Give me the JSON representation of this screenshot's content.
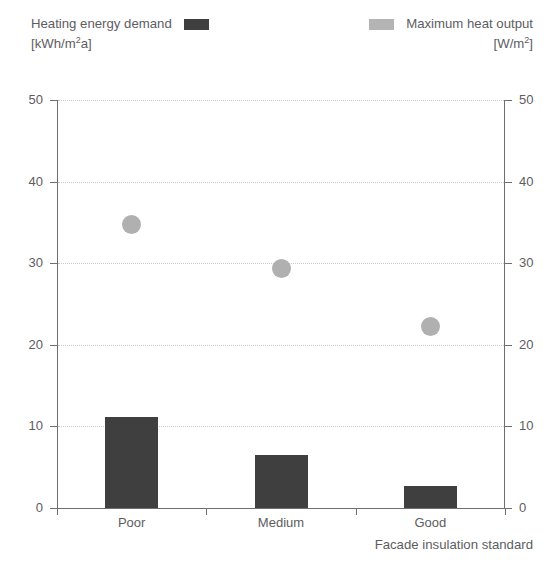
{
  "legend": {
    "left": {
      "label": "Heating energy demand",
      "units": "[kWh/m²a]",
      "units_base": "[kWh/m",
      "units_sup": "2",
      "units_tail": "a]",
      "swatch": "bar-swatch",
      "color": "#3f3f3f"
    },
    "right": {
      "label": "Maximum heat output",
      "units": "[W/m²]",
      "units_base": "[W/m",
      "units_sup": "2",
      "units_tail": "]",
      "swatch": "dot-swatch",
      "color": "#b0b0b0"
    }
  },
  "axes": {
    "x_title": "Facade insulation standard",
    "y_left_ticks": [
      "50",
      "40",
      "30",
      "20",
      "10",
      "0"
    ],
    "y_right_ticks": [
      "50",
      "40",
      "30",
      "20",
      "10",
      "0"
    ]
  },
  "chart_data": {
    "type": "bar",
    "title": "",
    "subtitle": "",
    "categories": [
      "Poor",
      "Medium",
      "Good"
    ],
    "xlabel": "Facade insulation standard",
    "ylabel": "",
    "ylim": [
      0,
      50
    ],
    "y2lim": [
      0,
      50
    ],
    "ytick_values": [
      0,
      10,
      20,
      30,
      40,
      50
    ],
    "y2tick_values": [
      0,
      10,
      20,
      30,
      40,
      50
    ],
    "grid": true,
    "grid_style": "dotted-horizontal",
    "legend_position": "top",
    "series": [
      {
        "name": "Heating energy demand",
        "units": "kWh/m²a",
        "type": "bar",
        "axis": "left",
        "color": "#3f3f3f",
        "values": [
          11.2,
          6.5,
          2.7
        ]
      },
      {
        "name": "Maximum heat output",
        "units": "W/m²",
        "type": "scatter",
        "axis": "right",
        "color": "#b0b0b0",
        "values": [
          34.8,
          29.4,
          22.3
        ]
      }
    ]
  }
}
